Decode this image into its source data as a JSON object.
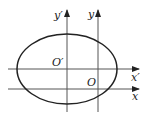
{
  "diagram": {
    "type": "coordinate-translation",
    "labels": {
      "y_prime": "y′",
      "y": "y",
      "o_prime": "O′",
      "o": "O",
      "x_prime": "x′",
      "x": "x"
    },
    "colors": {
      "axis": "#555555",
      "ellipse": "#222222"
    },
    "ellipse": {
      "cx": 67,
      "cy": 69,
      "rx": 50,
      "ry": 35
    }
  }
}
